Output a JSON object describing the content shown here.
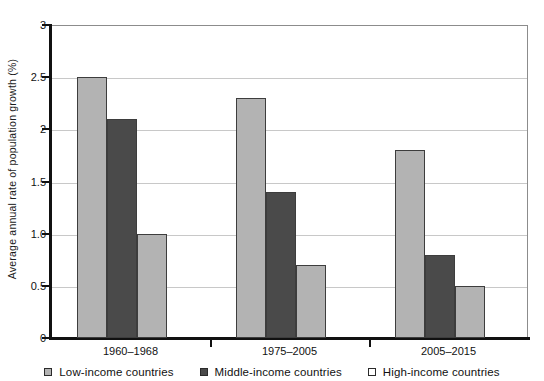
{
  "chart_data": {
    "type": "bar",
    "title": "",
    "subtitle": "",
    "xlabel": "",
    "ylabel": "Average annual rate of population growth (%)",
    "categories": [
      "1960–1968",
      "1975–2005",
      "2005–2015"
    ],
    "series": [
      {
        "name": "Low-income countries",
        "values": [
          2.5,
          2.3,
          1.8
        ],
        "color": "#b3b3b3"
      },
      {
        "name": "Middle-income countries",
        "values": [
          2.1,
          1.4,
          0.8
        ],
        "color": "#4a4a4a"
      },
      {
        "name": "High-income countries",
        "values": [
          1.0,
          0.7,
          0.5
        ],
        "color": "#b3b3b3"
      }
    ],
    "ylim": [
      0,
      3
    ],
    "ytick_values": [
      0,
      0.5,
      1.0,
      1.5,
      2,
      2.5,
      3
    ],
    "ytick_labels": [
      "0",
      "0.5",
      "1.0",
      "1.5",
      "2",
      "2.5",
      "3"
    ],
    "grid": true,
    "grid_axis": "y",
    "legend_position": "bottom",
    "bar_border_color": "#3d3d3d",
    "gridline_color": "#c8c8c8",
    "axis_color": "#111111",
    "background_color": "#ffffff"
  },
  "legend": {
    "items": [
      {
        "label": "Low-income countries",
        "swatch": "legend-swatch-low-income"
      },
      {
        "label": "Middle-income countries",
        "swatch": "legend-swatch-middle-income"
      },
      {
        "label": "High-income countries",
        "swatch": "legend-swatch-high-income"
      }
    ]
  }
}
